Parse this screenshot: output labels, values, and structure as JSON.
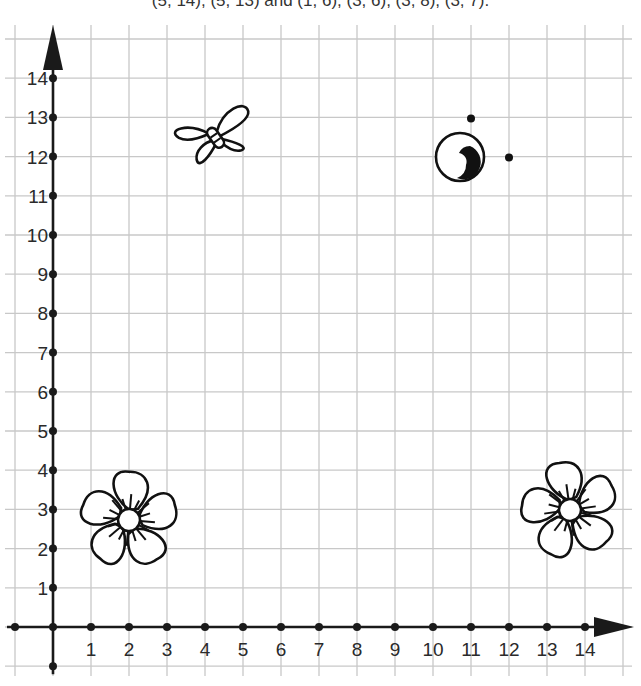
{
  "caption": "(5, 14), (5, 13) and (1, 6), (3, 6), (3, 8), (3, 7).",
  "colors": {
    "grid": "#c8c8c8",
    "axis": "#1a1a1a",
    "ink": "#111111"
  },
  "chart_data": {
    "type": "scatter",
    "title": "(5, 14), (5, 13) and (1, 6), (3, 6), (3, 8), (3, 7).",
    "xlabel": "",
    "ylabel": "",
    "xlim": [
      -1,
      15
    ],
    "ylim": [
      -1,
      15
    ],
    "grid": true,
    "x_ticks": [
      1,
      2,
      3,
      4,
      5,
      6,
      7,
      8,
      9,
      10,
      11,
      12,
      13,
      14
    ],
    "y_ticks": [
      1,
      2,
      3,
      4,
      5,
      6,
      7,
      8,
      9,
      10,
      11,
      12,
      13,
      14
    ],
    "points": [
      {
        "label": "dot",
        "x": 11,
        "y": 13
      },
      {
        "label": "dot",
        "x": 12,
        "y": 12
      }
    ],
    "pictures": [
      {
        "name": "butterfly",
        "x": 4.2,
        "y": 12.6
      },
      {
        "name": "snail-eye",
        "x": 10.7,
        "y": 12
      },
      {
        "name": "flower-left",
        "x": 2,
        "y": 2.7
      },
      {
        "name": "flower-right",
        "x": 13.6,
        "y": 3
      }
    ]
  },
  "axes": {
    "x_labels": [
      "1",
      "2",
      "3",
      "4",
      "5",
      "6",
      "7",
      "8",
      "9",
      "10",
      "11",
      "12",
      "13",
      "14"
    ],
    "y_labels": [
      "1",
      "2",
      "3",
      "4",
      "5",
      "6",
      "7",
      "8",
      "9",
      "10",
      "11",
      "12",
      "13",
      "14"
    ]
  }
}
